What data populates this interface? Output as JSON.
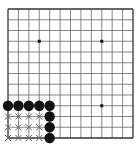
{
  "board": {
    "size": 13,
    "line_color": "#555555",
    "border_color": "#333333",
    "background": "#ffffff",
    "star_points": [
      [
        3,
        3
      ],
      [
        9,
        3
      ],
      [
        9,
        9
      ]
    ],
    "stones": [
      {
        "col": 0,
        "row": 9,
        "color": "black"
      },
      {
        "col": 1,
        "row": 9,
        "color": "black"
      },
      {
        "col": 2,
        "row": 9,
        "color": "black"
      },
      {
        "col": 3,
        "row": 9,
        "color": "black"
      },
      {
        "col": 4,
        "row": 9,
        "color": "black"
      },
      {
        "col": 4,
        "row": 10,
        "color": "black"
      },
      {
        "col": 4,
        "row": 11,
        "color": "black"
      },
      {
        "col": 4,
        "row": 12,
        "color": "black"
      }
    ],
    "markers": [
      {
        "col": 0,
        "row": 10,
        "type": "x"
      },
      {
        "col": 1,
        "row": 10,
        "type": "x"
      },
      {
        "col": 2,
        "row": 10,
        "type": "x"
      },
      {
        "col": 3,
        "row": 10,
        "type": "x"
      },
      {
        "col": 0,
        "row": 11,
        "type": "x"
      },
      {
        "col": 1,
        "row": 11,
        "type": "x"
      },
      {
        "col": 2,
        "row": 11,
        "type": "x"
      },
      {
        "col": 3,
        "row": 11,
        "type": "x"
      },
      {
        "col": 0,
        "row": 12,
        "type": "x"
      },
      {
        "col": 1,
        "row": 12,
        "type": "x"
      },
      {
        "col": 2,
        "row": 12,
        "type": "x"
      },
      {
        "col": 3,
        "row": 12,
        "type": "x"
      }
    ],
    "stone_colors": {
      "black": "#111111"
    },
    "marker_color": "#666666"
  }
}
